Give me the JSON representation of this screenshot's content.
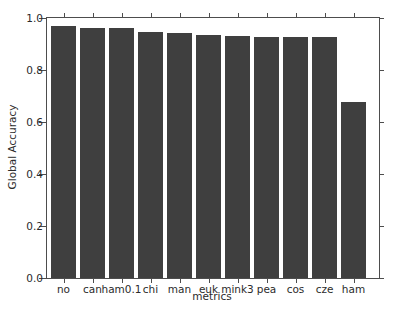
{
  "chart_data": {
    "type": "bar",
    "title": "",
    "xlabel": "metrics",
    "ylabel": "Global Accuracy",
    "categories": [
      "no",
      "can",
      "ham0.1",
      "chi",
      "man",
      "euk",
      "mink3",
      "pea",
      "cos",
      "cze",
      "ham"
    ],
    "values": [
      0.969,
      0.96,
      0.96,
      0.946,
      0.942,
      0.935,
      0.93,
      0.928,
      0.928,
      0.928,
      0.677
    ],
    "ylim": [
      0.0,
      1.0
    ],
    "yticks": [
      0.0,
      0.2,
      0.4,
      0.6,
      0.8,
      1.0
    ],
    "ytick_labels": [
      "0.0",
      "0.2",
      "0.4",
      "0.6",
      "0.8",
      "1.0"
    ],
    "grid": false,
    "legend": null,
    "bar_color": "#3f3f3f",
    "axis_color": "#4d4d4d",
    "background_color": "#ffffff"
  }
}
